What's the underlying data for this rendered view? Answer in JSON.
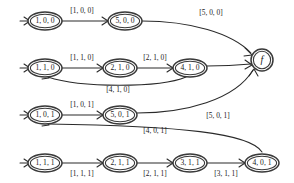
{
  "diagram": {
    "colors": {
      "stroke": "#2a2a2a",
      "node_stroke": "#3a3a3a",
      "background": "#ffffff",
      "text": "#1a1a1a"
    },
    "nodes": [
      {
        "id": "n1",
        "label": "1, 0, 0",
        "shape": "ellipse",
        "cx": 45,
        "cy": 21,
        "rx": 17,
        "ry": 9
      },
      {
        "id": "n2",
        "label": "5, 0, 0",
        "shape": "ellipse",
        "cx": 125,
        "cy": 21,
        "rx": 17,
        "ry": 9
      },
      {
        "id": "n3",
        "label": "1, 1, 0",
        "shape": "ellipse",
        "cx": 45,
        "cy": 68,
        "rx": 17,
        "ry": 9
      },
      {
        "id": "n4",
        "label": "2, 1, 0",
        "shape": "ellipse",
        "cx": 120,
        "cy": 68,
        "rx": 17,
        "ry": 9
      },
      {
        "id": "n5",
        "label": "4, 1, 0",
        "shape": "ellipse",
        "cx": 190,
        "cy": 68,
        "rx": 17,
        "ry": 9
      },
      {
        "id": "n6",
        "label": "1, 0, 1",
        "shape": "ellipse",
        "cx": 45,
        "cy": 115,
        "rx": 17,
        "ry": 9
      },
      {
        "id": "n7",
        "label": "5, 0, 1",
        "shape": "ellipse",
        "cx": 120,
        "cy": 115,
        "rx": 17,
        "ry": 9
      },
      {
        "id": "n8",
        "label": "1, 1, 1",
        "shape": "ellipse",
        "cx": 45,
        "cy": 163,
        "rx": 17,
        "ry": 9
      },
      {
        "id": "n9",
        "label": "2, 1, 1",
        "shape": "ellipse",
        "cx": 120,
        "cy": 163,
        "rx": 17,
        "ry": 9
      },
      {
        "id": "n10",
        "label": "3, 1, 1",
        "shape": "ellipse",
        "cx": 190,
        "cy": 163,
        "rx": 17,
        "ry": 9
      },
      {
        "id": "n11",
        "label": "4, 0, 1",
        "shape": "ellipse",
        "cx": 262,
        "cy": 163,
        "rx": 17,
        "ry": 9
      },
      {
        "id": "nf",
        "label": "f",
        "shape": "circle",
        "cx": 262,
        "cy": 60,
        "rx": 11,
        "ry": 11
      }
    ],
    "edge_labels": [
      {
        "id": "e1",
        "text": "[1, 0, 0]",
        "x": 82,
        "y": 11
      },
      {
        "id": "e2",
        "text": "[5, 0, 0]",
        "x": 211,
        "y": 13
      },
      {
        "id": "e3",
        "text": "[1, 1, 0]",
        "x": 82,
        "y": 58
      },
      {
        "id": "e4",
        "text": "[2, 1, 0]",
        "x": 155,
        "y": 58
      },
      {
        "id": "e5",
        "text": "[4, 1, 0]",
        "x": 118,
        "y": 90
      },
      {
        "id": "e6",
        "text": "[1, 0, 1]",
        "x": 82,
        "y": 105
      },
      {
        "id": "e7",
        "text": "[5, 0, 1]",
        "x": 218,
        "y": 116
      },
      {
        "id": "e8",
        "text": "[4, 0, 1]",
        "x": 155,
        "y": 131
      },
      {
        "id": "e9",
        "text": "[1, 1, 1]",
        "x": 82,
        "y": 174
      },
      {
        "id": "e10",
        "text": "[2, 1, 1]",
        "x": 155,
        "y": 174
      },
      {
        "id": "e11",
        "text": "[3, 1, 1]",
        "x": 226,
        "y": 174
      }
    ],
    "edges": [
      {
        "id": "p-start-1",
        "from": "start",
        "to": "n1",
        "d": "M 20,21 L 28,21"
      },
      {
        "id": "p-1-2",
        "from": "n1",
        "to": "n2",
        "d": "M 62,21 L 108,21"
      },
      {
        "id": "p-2-f",
        "from": "n2",
        "to": "nf",
        "d": "M 142,21 C 190,21 232,33 251,53"
      },
      {
        "id": "p-start-3",
        "from": "start",
        "to": "n3",
        "d": "M 20,68 L 28,68"
      },
      {
        "id": "p-3-4",
        "from": "n3",
        "to": "n4",
        "d": "M 62,68 L 103,68"
      },
      {
        "id": "p-4-5",
        "from": "n4",
        "to": "n5",
        "d": "M 137,68 L 173,68"
      },
      {
        "id": "p-5-3",
        "from": "n5",
        "to": "n3",
        "d": "M 186,77 C 160,88 80,88 48,77"
      },
      {
        "id": "p-5-f",
        "from": "n5",
        "to": "nf",
        "d": "M 207,66 C 226,66 240,65 251,64"
      },
      {
        "id": "p-start-6",
        "from": "start",
        "to": "n6",
        "d": "M 20,115 L 28,115"
      },
      {
        "id": "p-6-7",
        "from": "n6",
        "to": "n7",
        "d": "M 62,115 L 103,115"
      },
      {
        "id": "p-7-f",
        "from": "n7",
        "to": "nf",
        "d": "M 137,113 C 185,113 235,100 253,70"
      },
      {
        "id": "p-11-6",
        "from": "n11",
        "to": "n6",
        "d": "M 262,152 C 250,133 180,126 48,124"
      },
      {
        "id": "p-start-8",
        "from": "start",
        "to": "n8",
        "d": "M 20,163 L 28,163"
      },
      {
        "id": "p-8-9",
        "from": "n8",
        "to": "n9",
        "d": "M 62,163 L 103,163"
      },
      {
        "id": "p-9-10",
        "from": "n9",
        "to": "n10",
        "d": "M 137,163 L 173,163"
      },
      {
        "id": "p-10-11",
        "from": "n10",
        "to": "n11",
        "d": "M 207,163 L 245,163"
      }
    ],
    "arrows": [
      {
        "id": "a-start-1",
        "d": "M 24,17 L 30,21 L 24,25"
      },
      {
        "id": "a-1-2",
        "d": "M 102,17 L 108,21 L 102,25"
      },
      {
        "id": "a-2-f",
        "d": "M 245,48 L 252,55 L 244,56"
      },
      {
        "id": "a-start-3",
        "d": "M 24,64 L 30,68 L 24,72"
      },
      {
        "id": "a-3-4",
        "d": "M 97,64 L 103,68 L 97,72"
      },
      {
        "id": "a-4-5",
        "d": "M 167,64 L 173,68 L 167,72"
      },
      {
        "id": "a-5-3",
        "d": "M 44,71 L 49,78 L 42,79"
      },
      {
        "id": "a-5-f",
        "d": "M 245,60 L 252,65 L 245,69"
      },
      {
        "id": "a-start-6",
        "d": "M 24,111 L 30,115 L 24,119"
      },
      {
        "id": "a-6-7",
        "d": "M 97,111 L 103,115 L 97,119"
      },
      {
        "id": "a-7-f",
        "d": "M 249,76 L 254,69 L 258,76"
      },
      {
        "id": "a-11-6",
        "d": "M 44,118 L 49,125 L 42,126"
      },
      {
        "id": "a-start-8",
        "d": "M 24,159 L 30,163 L 24,167"
      },
      {
        "id": "a-8-9",
        "d": "M 97,159 L 103,163 L 97,167"
      },
      {
        "id": "a-9-10",
        "d": "M 167,159 L 173,163 L 167,167"
      },
      {
        "id": "a-10-11",
        "d": "M 239,159 L 245,163 L 239,167"
      }
    ]
  }
}
